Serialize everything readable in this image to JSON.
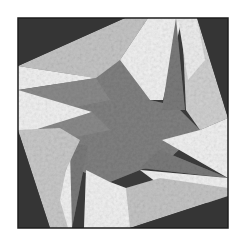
{
  "image": {
    "subject": "Quilt block with pinwheel star pattern",
    "colors": {
      "background": "#ffffff",
      "border": "#1e1e1e",
      "dark": "#3a3a3a",
      "medium": "#808080",
      "light": "#c4c4c4",
      "white": "#f2f2f2"
    }
  }
}
